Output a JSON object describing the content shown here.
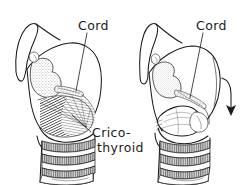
{
  "figure": {
    "kind": "anatomical-line-drawing",
    "background_color": "#ffffff",
    "ink_color": "#1c1c1c",
    "stipple_color": "#9a9a9a"
  },
  "labels": {
    "cord_left": "Cord",
    "cord_right": "Cord",
    "cricothyroid_line1": "Crico-",
    "cricothyroid_line2": "thyroid"
  },
  "panels": [
    {
      "id": "left-panel",
      "name": "larynx-at-rest",
      "muscle_state": "contracted-hatched",
      "arrow": false
    },
    {
      "id": "right-panel",
      "name": "larynx-tilted",
      "muscle_state": "shortened-relaxed",
      "arrow": true
    }
  ],
  "annotations": {
    "arrow_direction": "down",
    "arrow_name": "thyroid-tilt-arrow"
  }
}
